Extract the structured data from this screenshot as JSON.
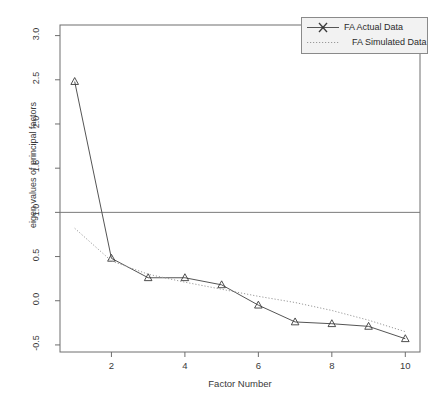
{
  "chart_data": {
    "type": "line",
    "title": "",
    "xlabel": "Factor Number",
    "ylabel": "eigen values of principal factors",
    "x": [
      1,
      2,
      3,
      4,
      5,
      6,
      7,
      8,
      9,
      10
    ],
    "xlim": [
      0.6,
      10.4
    ],
    "ylim": [
      -0.58,
      3.12
    ],
    "xticks": [
      2,
      4,
      6,
      8,
      10
    ],
    "xtick_labels": [
      "2",
      "4",
      "6",
      "8",
      "10"
    ],
    "yticks": [
      -0.5,
      0.0,
      0.5,
      1.0,
      1.5,
      2.0,
      2.5,
      3.0
    ],
    "ytick_labels": [
      "-0.5",
      "0.0",
      "0.5",
      "1.0",
      "1.5",
      "2.0",
      "2.5",
      "3.0"
    ],
    "grid": false,
    "hline": 1.0,
    "legend_position": "top-right",
    "series": [
      {
        "name": "FA  Actual Data",
        "style": "solid",
        "marker": "triangle",
        "color": "#555555",
        "values": [
          2.48,
          0.48,
          0.26,
          0.26,
          0.18,
          -0.05,
          -0.24,
          -0.26,
          -0.29,
          -0.43
        ]
      },
      {
        "name": "FA  Simulated Data",
        "style": "dotted",
        "marker": "none",
        "color": "#9a9a9a",
        "values": [
          0.82,
          0.45,
          0.3,
          0.21,
          0.13,
          0.05,
          -0.02,
          -0.11,
          -0.22,
          -0.35
        ]
      }
    ]
  },
  "legend": {
    "items": [
      {
        "label": "FA  Actual Data",
        "key": "solid-x-marker-key"
      },
      {
        "label": "FA  Simulated Data",
        "key": "dotted-line-key"
      }
    ]
  },
  "axes": {
    "x_title": "Factor Number",
    "y_title": "eigen values of principal factors"
  },
  "colors": {
    "actual": "#555555",
    "simulated": "#9a9a9a",
    "frame": "#6e6e6e",
    "hline": "#7a7a7a",
    "text": "#3a3a3a",
    "legend_bg": "#f2f2f2",
    "legend_border": "#8a8a8a"
  }
}
